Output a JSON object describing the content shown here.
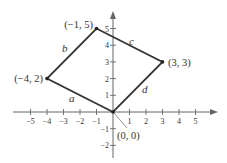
{
  "diagram": {
    "type": "coordinate-plane-quadrilateral",
    "colors": {
      "axis": "#555555",
      "shape": "#333333",
      "text": "#333333"
    },
    "axes": {
      "x_ticks": [
        "-5",
        "-4",
        "-3",
        "-2",
        "-1",
        "1",
        "2",
        "3",
        "4",
        "5"
      ],
      "y_ticks": [
        "-2",
        "-1",
        "1",
        "2",
        "3",
        "4",
        "5"
      ],
      "x_range": [
        -5,
        5
      ],
      "y_range": [
        -2,
        5
      ]
    },
    "vertices": [
      {
        "label": "(0, 0)",
        "x": 0,
        "y": 0
      },
      {
        "label": "(-4, 2)",
        "x": -4,
        "y": 2
      },
      {
        "label": "(-1, 5)",
        "x": -1,
        "y": 5
      },
      {
        "label": "(3, 3)",
        "x": 3,
        "y": 3
      }
    ],
    "sides": [
      {
        "label": "a",
        "from": "(0, 0)",
        "to": "(-4, 2)"
      },
      {
        "label": "b",
        "from": "(-4, 2)",
        "to": "(-1, 5)"
      },
      {
        "label": "c",
        "from": "(-1, 5)",
        "to": "(3, 3)"
      },
      {
        "label": "d",
        "from": "(3, 3)",
        "to": "(0, 0)"
      }
    ]
  }
}
